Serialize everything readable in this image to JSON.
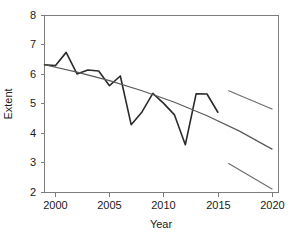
{
  "chart_data": {
    "type": "line",
    "title": "",
    "xlabel": "Year",
    "ylabel": "Extent",
    "xlim": [
      1999,
      2020.6
    ],
    "ylim": [
      2,
      8
    ],
    "grid": false,
    "legend": "none",
    "x_ticks": [
      "2000",
      "2005",
      "2010",
      "2015",
      "2020"
    ],
    "x_tick_values": [
      2000,
      2005,
      2010,
      2015,
      2020
    ],
    "y_ticks": [
      "2",
      "3",
      "4",
      "5",
      "6",
      "7",
      "8"
    ],
    "y_tick_values": [
      2,
      3,
      4,
      5,
      6,
      7,
      8
    ],
    "series": [
      {
        "name": "Observed extent",
        "type": "line",
        "color": "#2b2b2b",
        "x": [
          1999,
          2000,
          2001,
          2002,
          2003,
          2004,
          2005,
          2006,
          2007,
          2008,
          2009,
          2010,
          2011,
          2012,
          2013,
          2014,
          2015
        ],
        "values": [
          6.33,
          6.3,
          6.75,
          6.02,
          6.15,
          6.12,
          5.62,
          5.95,
          4.3,
          4.73,
          5.36,
          5.02,
          4.63,
          3.62,
          5.35,
          5.34,
          4.72
        ]
      },
      {
        "name": "Fitted trend",
        "type": "line",
        "color": "#5a5a5a",
        "x": [
          1999,
          2002,
          2005,
          2008,
          2011,
          2014,
          2017,
          2020
        ],
        "values": [
          6.33,
          6.08,
          5.79,
          5.45,
          5.06,
          4.6,
          4.08,
          3.47
        ]
      },
      {
        "name": "Projection upper bound",
        "type": "line",
        "color": "#6e6e6e",
        "x": [
          2016,
          2020
        ],
        "values": [
          5.45,
          4.83
        ]
      },
      {
        "name": "Projection lower bound",
        "type": "line",
        "color": "#6e6e6e",
        "x": [
          2016,
          2020
        ],
        "values": [
          2.98,
          2.12
        ]
      }
    ]
  },
  "axes": {
    "y_label": "Extent",
    "x_label": "Year",
    "y_tick_labels": [
      "8",
      "7",
      "6",
      "5",
      "4",
      "3",
      "2"
    ],
    "x_tick_labels": [
      "2000",
      "2005",
      "2010",
      "2015",
      "2020"
    ]
  },
  "colors": {
    "series_primary": "#2b2b2b",
    "trend": "#5a5a5a",
    "projection": "#6e6e6e",
    "frame": "#7d7d7d",
    "background": "#ffffff"
  }
}
